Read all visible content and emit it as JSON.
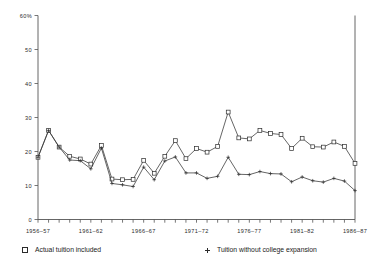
{
  "chart_data": {
    "type": "line",
    "title": "",
    "subtitle": "",
    "xlabel": "",
    "ylabel": "",
    "ylim": [
      0,
      60
    ],
    "y_ticks": [
      0,
      10,
      20,
      30,
      40,
      50,
      60
    ],
    "y_tick_labels": [
      "0",
      "10",
      "20",
      "30",
      "40",
      "50",
      "60%"
    ],
    "grid": false,
    "legend_position": "bottom",
    "x": [
      "1956-57",
      "1957-58",
      "1958-59",
      "1959-60",
      "1960-61",
      "1961-62",
      "1962-63",
      "1963-64",
      "1964-65",
      "1965-66",
      "1966-67",
      "1967-68",
      "1968-69",
      "1969-70",
      "1970-71",
      "1971-72",
      "1972-73",
      "1973-74",
      "1974-75",
      "1975-76",
      "1976-77",
      "1977-78",
      "1978-79",
      "1979-80",
      "1980-81",
      "1981-82",
      "1982-83",
      "1983-84",
      "1984-85",
      "1985-86",
      "1986-87"
    ],
    "x_tick_labels": [
      "1956-57",
      "1961-62",
      "1966-67",
      "1971-72",
      "1976-77",
      "1981-82",
      "1986-87"
    ],
    "x_tick_indices": [
      0,
      5,
      10,
      15,
      20,
      25,
      30
    ],
    "series": [
      {
        "name": "Actual tuition included",
        "marker": "square",
        "values": [
          18.3,
          26.2,
          21.3,
          18.6,
          17.8,
          16.3,
          21.8,
          11.9,
          11.7,
          11.8,
          17.4,
          13.6,
          18.6,
          23.2,
          17.9,
          20.9,
          19.8,
          21.5,
          31.6,
          24.0,
          23.7,
          26.2,
          25.3,
          25.0,
          20.9,
          23.9,
          21.4,
          21.3,
          22.8,
          21.5,
          16.5
        ]
      },
      {
        "name": "Tuition without college expansion",
        "marker": "cross",
        "values": [
          18.3,
          26.2,
          21.3,
          17.5,
          17.3,
          14.9,
          21.0,
          10.6,
          10.2,
          9.7,
          15.4,
          11.7,
          17.2,
          18.4,
          13.7,
          13.7,
          12.1,
          12.7,
          18.3,
          13.3,
          13.2,
          14.1,
          13.5,
          13.4,
          11.1,
          12.5,
          11.4,
          11.0,
          12.1,
          11.3,
          8.5
        ]
      }
    ]
  },
  "legend": {
    "entries": [
      {
        "label": "Actual tuition included",
        "marker": "square"
      },
      {
        "label": "Tuition without college expansion",
        "marker": "cross"
      }
    ]
  }
}
